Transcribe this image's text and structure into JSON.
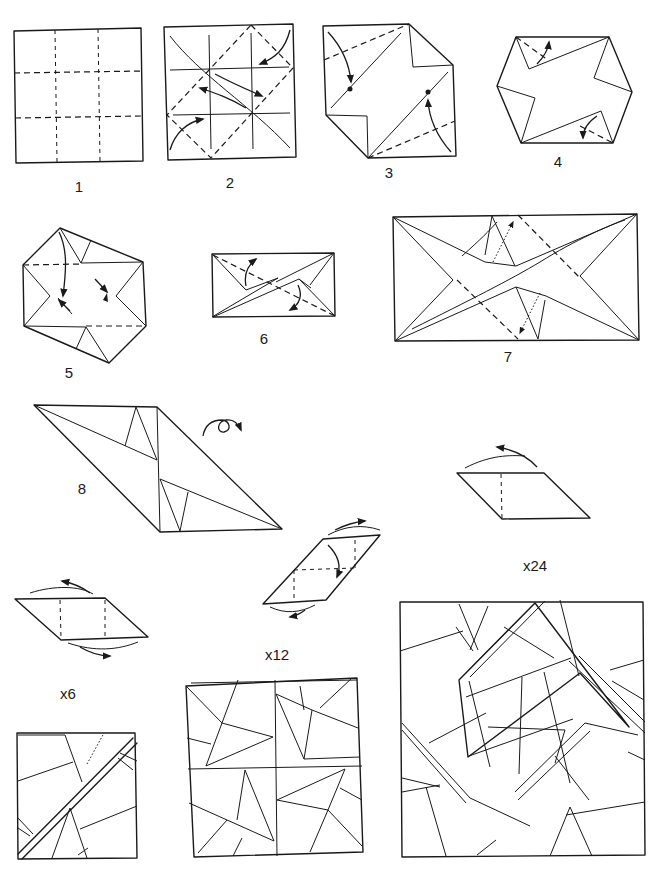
{
  "diagram": {
    "type": "origami-instructions",
    "steps": [
      {
        "id": 1,
        "label": "1"
      },
      {
        "id": 2,
        "label": "2"
      },
      {
        "id": 3,
        "label": "3"
      },
      {
        "id": 4,
        "label": "4"
      },
      {
        "id": 5,
        "label": "5"
      },
      {
        "id": 6,
        "label": "6"
      },
      {
        "id": 7,
        "label": "7"
      },
      {
        "id": 8,
        "label": "8"
      }
    ],
    "assembly": {
      "unit_count_large": "x24",
      "unit_count_medium": "x12",
      "unit_count_small": "x6"
    },
    "colors": {
      "ink": "#1a1a1a",
      "paper": "#ffffff"
    }
  }
}
